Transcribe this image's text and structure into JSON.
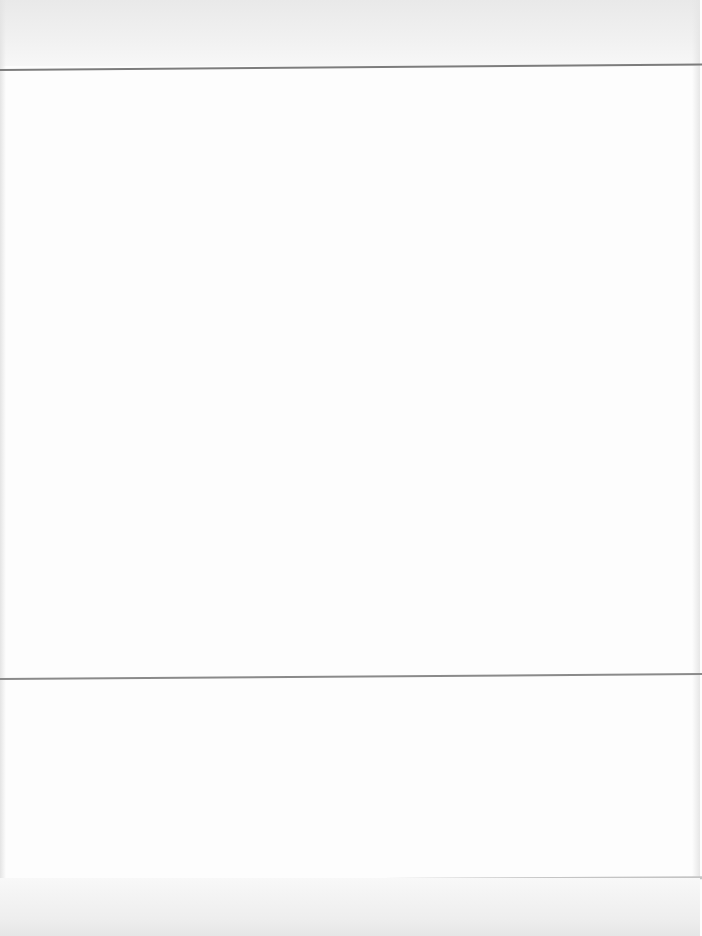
{
  "document": {
    "type": "scanned page (heavily overexposed, text illegible)",
    "sections": [
      {
        "id": "header-block",
        "text": ""
      },
      {
        "id": "body-block",
        "text": ""
      },
      {
        "id": "lower-block",
        "text": ""
      }
    ]
  },
  "colors": {
    "background": "#fdfdfd",
    "scan_band": "#ebebeb",
    "rule": "#7c7c7c"
  }
}
